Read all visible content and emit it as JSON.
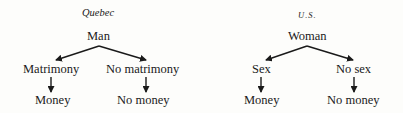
{
  "diagrams": [
    {
      "title": "Quebec",
      "root": "Man",
      "branches": [
        {
          "condition": "Matrimony",
          "outcome": "Money"
        },
        {
          "condition": "No matrimony",
          "outcome": "No money"
        }
      ]
    },
    {
      "title": "U.S.",
      "root": "Woman",
      "branches": [
        {
          "condition": "Sex",
          "outcome": "Money"
        },
        {
          "condition": "No sex",
          "outcome": "No money"
        }
      ]
    }
  ]
}
